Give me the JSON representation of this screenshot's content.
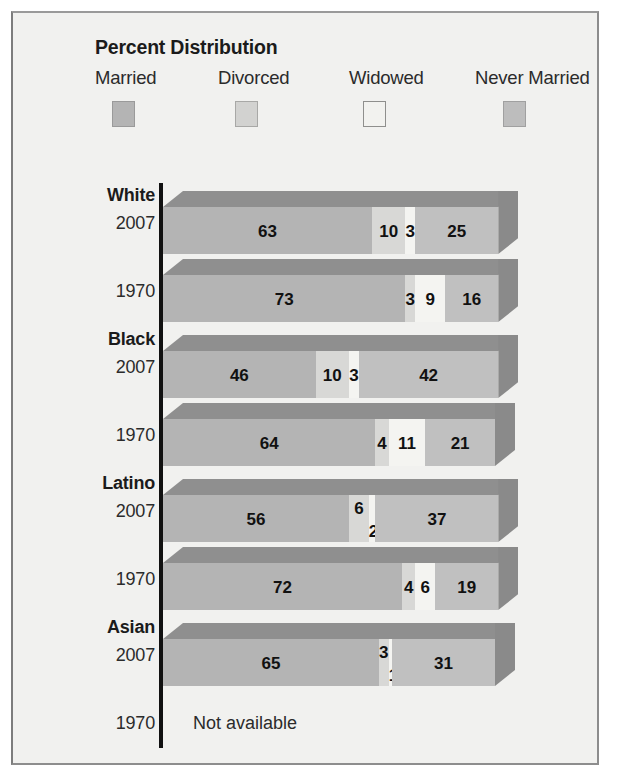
{
  "legend": {
    "title": "Percent Distribution",
    "items": [
      {
        "label": "Married",
        "color": "#b4b4b4",
        "border": "#9a9a9a"
      },
      {
        "label": "Divorced",
        "color": "#d2d2d0",
        "border": "#a8a8a6"
      },
      {
        "label": "Widowed",
        "color": "#f2f2ef",
        "border": "#8f8f8d"
      },
      {
        "label": "Never Married",
        "color": "#bdbdbd",
        "border": "#a0a0a0"
      }
    ]
  },
  "colors": {
    "panel_background": "#f1f1ef",
    "panel_border": "#8d8d8d",
    "axis": "#111111",
    "married_face": "#b4b4b4",
    "divorced_face": "#d8d8d6",
    "widowed_face": "#f4f4f1",
    "never_married_face": "#c0c0c0",
    "top_face": "#8f8f8f",
    "side_face": "#8a8a8a",
    "value_text": "#111111"
  },
  "chart_data": {
    "type": "bar",
    "orientation": "horizontal",
    "stacked": true,
    "title": "Percent Distribution",
    "xlabel": "",
    "ylabel": "",
    "xlim": [
      0,
      100
    ],
    "grid": false,
    "legend_position": "top",
    "categories": [
      "Married",
      "Divorced",
      "Widowed",
      "Never Married"
    ],
    "groups": [
      {
        "name": "White",
        "rows": [
          {
            "year": "2007",
            "available": true,
            "values": [
              63,
              10,
              3,
              25
            ]
          },
          {
            "year": "1970",
            "available": true,
            "values": [
              73,
              3,
              9,
              16
            ]
          }
        ]
      },
      {
        "name": "Black",
        "rows": [
          {
            "year": "2007",
            "available": true,
            "values": [
              46,
              10,
              3,
              42
            ]
          },
          {
            "year": "1970",
            "available": true,
            "values": [
              64,
              4,
              11,
              21
            ]
          }
        ]
      },
      {
        "name": "Latino",
        "rows": [
          {
            "year": "2007",
            "available": true,
            "values": [
              56,
              6,
              2,
              37
            ]
          },
          {
            "year": "1970",
            "available": true,
            "values": [
              72,
              4,
              6,
              19
            ]
          }
        ]
      },
      {
        "name": "Asian",
        "rows": [
          {
            "year": "2007",
            "available": true,
            "values": [
              65,
              3,
              1,
              31
            ]
          },
          {
            "year": "1970",
            "available": false,
            "values": [],
            "note": "Not available"
          }
        ]
      }
    ]
  }
}
